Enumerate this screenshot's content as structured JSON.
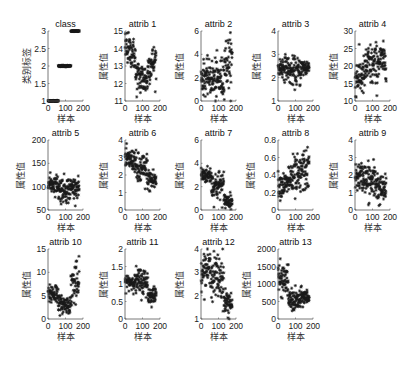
{
  "figure": {
    "xlabel": "样本",
    "ylabel_class": "类别标签",
    "ylabel_attr": "属性值",
    "marker": "*",
    "marker_color": "#1a1a1a",
    "axis_color": "#555555"
  },
  "chart_data": [
    {
      "type": "scatter",
      "title": "class",
      "ylabel": "类别标签",
      "xlabel": "样本",
      "xlim": [
        0,
        200
      ],
      "ylim": [
        1,
        3
      ],
      "xticks": [
        0,
        100,
        200
      ],
      "yticks": [
        1,
        1.5,
        2,
        2.5,
        3
      ],
      "ytick_labels": [
        "1",
        "1.5",
        "2",
        "2.5",
        "3"
      ],
      "segments": [
        {
          "x": [
            1,
            59
          ],
          "y": [
            1,
            1
          ],
          "spread": 0.01
        },
        {
          "x": [
            60,
            130
          ],
          "y": [
            2,
            2
          ],
          "spread": 0.01
        },
        {
          "x": [
            131,
            178
          ],
          "y": [
            3,
            3
          ],
          "spread": 0.01
        }
      ]
    },
    {
      "type": "scatter",
      "title": "attrib 1",
      "ylabel": "属性值",
      "xlabel": "样本",
      "xlim": [
        0,
        200
      ],
      "ylim": [
        11,
        15
      ],
      "xticks": [
        0,
        100,
        200
      ],
      "yticks": [
        11,
        12,
        13,
        14,
        15
      ],
      "ytick_labels": [
        "11",
        "12",
        "13",
        "14",
        "15"
      ],
      "segments": [
        {
          "x": [
            1,
            59
          ],
          "y": [
            14.1,
            13.6
          ],
          "spread": 0.45
        },
        {
          "x": [
            60,
            130
          ],
          "y": [
            12.4,
            12.2
          ],
          "spread": 0.5
        },
        {
          "x": [
            131,
            178
          ],
          "y": [
            13.0,
            13.3
          ],
          "spread": 0.5
        }
      ]
    },
    {
      "type": "scatter",
      "title": "attrib 2",
      "ylabel": "属性值",
      "xlabel": "样本",
      "xlim": [
        0,
        200
      ],
      "ylim": [
        0,
        6
      ],
      "xticks": [
        0,
        100,
        200
      ],
      "yticks": [
        0,
        2,
        4,
        6
      ],
      "ytick_labels": [
        "0",
        "2",
        "4",
        "6"
      ],
      "segments": [
        {
          "x": [
            1,
            59
          ],
          "y": [
            2.0,
            2.0
          ],
          "spread": 0.7
        },
        {
          "x": [
            60,
            130
          ],
          "y": [
            1.8,
            1.9
          ],
          "spread": 0.9
        },
        {
          "x": [
            131,
            178
          ],
          "y": [
            3.3,
            3.3
          ],
          "spread": 1.1
        }
      ]
    },
    {
      "type": "scatter",
      "title": "attrib 3",
      "ylabel": "属性值",
      "xlabel": "样本",
      "xlim": [
        0,
        200
      ],
      "ylim": [
        1,
        4
      ],
      "xticks": [
        0,
        100,
        200
      ],
      "yticks": [
        1,
        2,
        3,
        4
      ],
      "ytick_labels": [
        "1",
        "2",
        "3",
        "4"
      ],
      "segments": [
        {
          "x": [
            1,
            59
          ],
          "y": [
            2.45,
            2.45
          ],
          "spread": 0.25
        },
        {
          "x": [
            60,
            130
          ],
          "y": [
            2.25,
            2.25
          ],
          "spread": 0.3
        },
        {
          "x": [
            131,
            178
          ],
          "y": [
            2.43,
            2.43
          ],
          "spread": 0.2
        }
      ]
    },
    {
      "type": "scatter",
      "title": "attrib 4",
      "ylabel": "属性值",
      "xlabel": "样本",
      "xlim": [
        0,
        200
      ],
      "ylim": [
        10,
        30
      ],
      "xticks": [
        0,
        100,
        200
      ],
      "yticks": [
        10,
        15,
        20,
        25,
        30
      ],
      "ytick_labels": [
        "10",
        "15",
        "20",
        "25",
        "30"
      ],
      "segments": [
        {
          "x": [
            1,
            59
          ],
          "y": [
            17,
            17
          ],
          "spread": 2.8
        },
        {
          "x": [
            60,
            130
          ],
          "y": [
            20,
            20
          ],
          "spread": 3.2
        },
        {
          "x": [
            131,
            178
          ],
          "y": [
            21.5,
            21.5
          ],
          "spread": 2.3
        }
      ]
    },
    {
      "type": "scatter",
      "title": "attrib 5",
      "ylabel": "属性值",
      "xlabel": "样本",
      "xlim": [
        0,
        200
      ],
      "ylim": [
        50,
        200
      ],
      "xticks": [
        0,
        100,
        200
      ],
      "yticks": [
        50,
        100,
        150,
        200
      ],
      "ytick_labels": [
        "50",
        "100",
        "150",
        "200"
      ],
      "segments": [
        {
          "x": [
            1,
            59
          ],
          "y": [
            106,
            106
          ],
          "spread": 10
        },
        {
          "x": [
            60,
            130
          ],
          "y": [
            94,
            94
          ],
          "spread": 14
        },
        {
          "x": [
            131,
            178
          ],
          "y": [
            99,
            99
          ],
          "spread": 10
        }
      ]
    },
    {
      "type": "scatter",
      "title": "attrib 6",
      "ylabel": "属性值",
      "xlabel": "样本",
      "xlim": [
        0,
        200
      ],
      "ylim": [
        0,
        4
      ],
      "xticks": [
        0,
        100,
        200
      ],
      "yticks": [
        0,
        1,
        2,
        3,
        4
      ],
      "ytick_labels": [
        "0",
        "1",
        "2",
        "3",
        "4"
      ],
      "segments": [
        {
          "x": [
            1,
            59
          ],
          "y": [
            2.85,
            2.85
          ],
          "spread": 0.3
        },
        {
          "x": [
            60,
            130
          ],
          "y": [
            2.25,
            2.25
          ],
          "spread": 0.5
        },
        {
          "x": [
            131,
            178
          ],
          "y": [
            1.7,
            1.7
          ],
          "spread": 0.35
        }
      ]
    },
    {
      "type": "scatter",
      "title": "attrib 7",
      "ylabel": "属性值",
      "xlabel": "样本",
      "xlim": [
        0,
        200
      ],
      "ylim": [
        0,
        6
      ],
      "xticks": [
        0,
        100,
        200
      ],
      "yticks": [
        0,
        2,
        4,
        6
      ],
      "ytick_labels": [
        "0",
        "2",
        "4",
        "6"
      ],
      "segments": [
        {
          "x": [
            1,
            59
          ],
          "y": [
            3.0,
            3.0
          ],
          "spread": 0.35
        },
        {
          "x": [
            60,
            130
          ],
          "y": [
            2.1,
            2.1
          ],
          "spread": 0.65
        },
        {
          "x": [
            131,
            178
          ],
          "y": [
            0.8,
            0.8
          ],
          "spread": 0.3
        }
      ]
    },
    {
      "type": "scatter",
      "title": "attrib 8",
      "ylabel": "属性值",
      "xlabel": "样本",
      "xlim": [
        0,
        200
      ],
      "ylim": [
        0,
        0.8
      ],
      "xticks": [
        0,
        100,
        200
      ],
      "yticks": [
        0,
        0.2,
        0.4,
        0.6,
        0.8
      ],
      "ytick_labels": [
        "0",
        "0.2",
        "0.4",
        "0.6",
        "0.8"
      ],
      "segments": [
        {
          "x": [
            1,
            59
          ],
          "y": [
            0.29,
            0.29
          ],
          "spread": 0.07
        },
        {
          "x": [
            60,
            130
          ],
          "y": [
            0.36,
            0.36
          ],
          "spread": 0.12
        },
        {
          "x": [
            131,
            178
          ],
          "y": [
            0.45,
            0.45
          ],
          "spread": 0.12
        }
      ]
    },
    {
      "type": "scatter",
      "title": "attrib 9",
      "ylabel": "属性值",
      "xlabel": "样本",
      "xlim": [
        0,
        200
      ],
      "ylim": [
        0,
        4
      ],
      "xticks": [
        0,
        100,
        200
      ],
      "yticks": [
        0,
        1,
        2,
        3,
        4
      ],
      "ytick_labels": [
        "0",
        "1",
        "2",
        "3",
        "4"
      ],
      "segments": [
        {
          "x": [
            1,
            59
          ],
          "y": [
            1.9,
            1.9
          ],
          "spread": 0.4
        },
        {
          "x": [
            60,
            130
          ],
          "y": [
            1.6,
            1.6
          ],
          "spread": 0.6
        },
        {
          "x": [
            131,
            178
          ],
          "y": [
            1.15,
            1.15
          ],
          "spread": 0.4
        }
      ]
    },
    {
      "type": "scatter",
      "title": "attrib 10",
      "ylabel": "属性值",
      "xlabel": "样本",
      "xlim": [
        0,
        200
      ],
      "ylim": [
        0,
        15
      ],
      "xticks": [
        0,
        100,
        200
      ],
      "yticks": [
        0,
        5,
        10,
        15
      ],
      "ytick_labels": [
        "0",
        "5",
        "10",
        "15"
      ],
      "segments": [
        {
          "x": [
            1,
            59
          ],
          "y": [
            5.5,
            5.5
          ],
          "spread": 1.2
        },
        {
          "x": [
            60,
            130
          ],
          "y": [
            3.1,
            3.1
          ],
          "spread": 0.9
        },
        {
          "x": [
            131,
            178
          ],
          "y": [
            7.4,
            7.4
          ],
          "spread": 2.3
        }
      ]
    },
    {
      "type": "scatter",
      "title": "attrib 11",
      "ylabel": "属性值",
      "xlabel": "样本",
      "xlim": [
        0,
        200
      ],
      "ylim": [
        0,
        2
      ],
      "xticks": [
        0,
        100,
        200
      ],
      "yticks": [
        0,
        0.5,
        1,
        1.5,
        2
      ],
      "ytick_labels": [
        "0",
        "0.5",
        "1",
        "1.5",
        "2"
      ],
      "segments": [
        {
          "x": [
            1,
            59
          ],
          "y": [
            1.06,
            1.06
          ],
          "spread": 0.11
        },
        {
          "x": [
            60,
            130
          ],
          "y": [
            1.06,
            1.06
          ],
          "spread": 0.2
        },
        {
          "x": [
            131,
            178
          ],
          "y": [
            0.68,
            0.68
          ],
          "spread": 0.12
        }
      ]
    },
    {
      "type": "scatter",
      "title": "attrib 12",
      "ylabel": "属性值",
      "xlabel": "样本",
      "xlim": [
        0,
        200
      ],
      "ylim": [
        1,
        4
      ],
      "xticks": [
        0,
        100,
        200
      ],
      "yticks": [
        1,
        2,
        3,
        4
      ],
      "ytick_labels": [
        "1",
        "2",
        "3",
        "4"
      ],
      "segments": [
        {
          "x": [
            1,
            59
          ],
          "y": [
            3.15,
            3.15
          ],
          "spread": 0.35
        },
        {
          "x": [
            60,
            130
          ],
          "y": [
            2.8,
            2.8
          ],
          "spread": 0.5
        },
        {
          "x": [
            131,
            178
          ],
          "y": [
            1.7,
            1.7
          ],
          "spread": 0.3
        }
      ]
    },
    {
      "type": "scatter",
      "title": "attrib 13",
      "ylabel": "属性值",
      "xlabel": "样本",
      "xlim": [
        0,
        200
      ],
      "ylim": [
        0,
        2000
      ],
      "xticks": [
        0,
        100,
        200
      ],
      "yticks": [
        0,
        500,
        1000,
        1500,
        2000
      ],
      "ytick_labels": [
        "0",
        "500",
        "1000",
        "1500",
        "2000"
      ],
      "segments": [
        {
          "x": [
            1,
            59
          ],
          "y": [
            1115,
            1115
          ],
          "spread": 220
        },
        {
          "x": [
            60,
            130
          ],
          "y": [
            520,
            520
          ],
          "spread": 160
        },
        {
          "x": [
            131,
            178
          ],
          "y": [
            630,
            630
          ],
          "spread": 120
        }
      ]
    }
  ],
  "layout": {
    "col_x": [
      48,
      125,
      201,
      278,
      355
    ],
    "row_top": [
      31,
      140,
      249
    ],
    "axis_w": 35,
    "axis_h": 70
  }
}
